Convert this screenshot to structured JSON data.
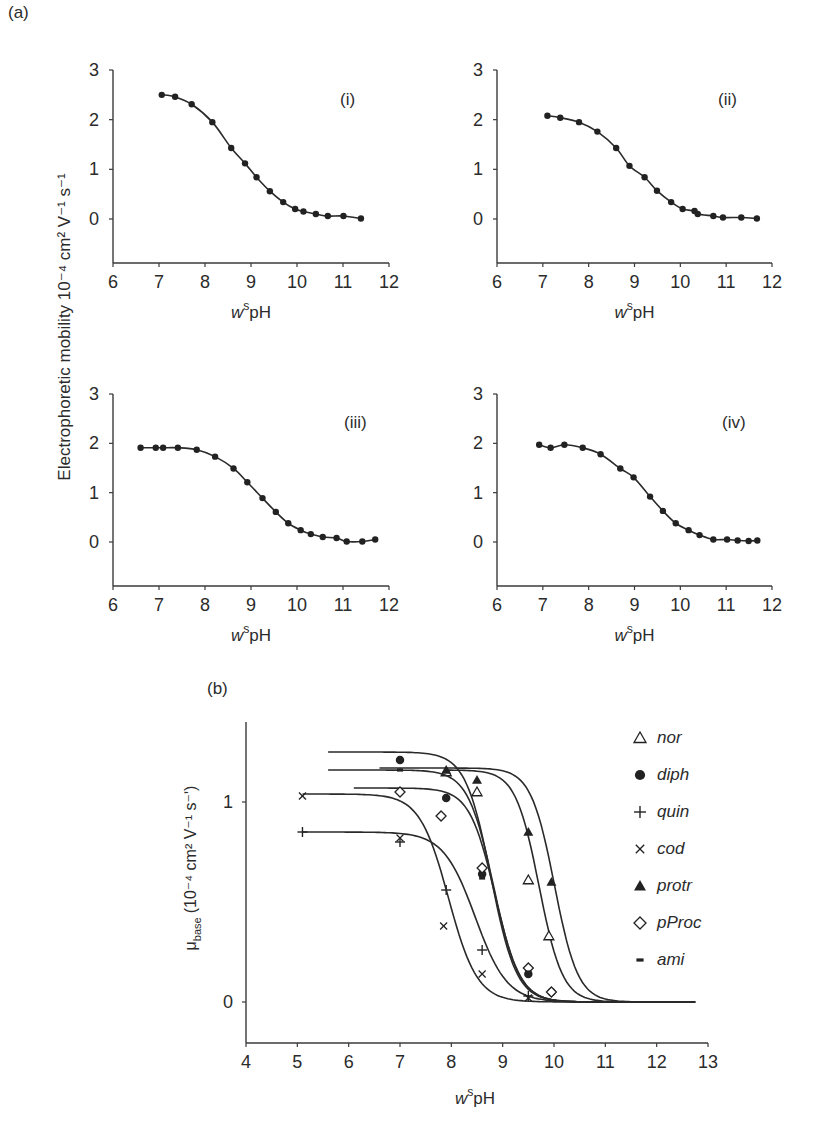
{
  "figure": {
    "label_a": "(a)",
    "label_b": "(b)",
    "ylabel_a": "Electrophoretic mobility 10⁻⁴ cm² V⁻¹ s⁻¹",
    "xlabel_prefix": "w",
    "xlabel_sup": "s",
    "xlabel_main": "pH",
    "ylabel_b_mu": "μ",
    "ylabel_b_sub": "base",
    "ylabel_b_units": "(10⁻⁴ cm² V⁻¹ s⁻ʹ)"
  },
  "chart_data": [
    {
      "type": "scatter",
      "panel": "(i)",
      "title": "(i)",
      "xlabel": "wspH",
      "ylabel": "Electrophoretic mobility 10^-4 cm^2 V^-1 s^-1",
      "xlim": [
        6,
        12
      ],
      "ylim": [
        -0.9,
        3
      ],
      "xticks": [
        6,
        7,
        8,
        9,
        10,
        11,
        12
      ],
      "yticks": [
        0,
        1,
        2,
        3
      ],
      "grid": false,
      "marker": "filled-circle",
      "fit_line": true,
      "x": [
        7.06,
        7.35,
        7.71,
        8.16,
        8.57,
        8.87,
        9.12,
        9.41,
        9.7,
        9.96,
        10.14,
        10.41,
        10.67,
        11.01,
        11.39
      ],
      "y": [
        2.5,
        2.46,
        2.31,
        1.95,
        1.43,
        1.12,
        0.84,
        0.56,
        0.34,
        0.2,
        0.15,
        0.1,
        0.06,
        0.06,
        0.01
      ]
    },
    {
      "type": "scatter",
      "panel": "(ii)",
      "title": "(ii)",
      "xlabel": "wspH",
      "xlim": [
        6,
        12
      ],
      "ylim": [
        -0.9,
        3
      ],
      "xticks": [
        6,
        7,
        8,
        9,
        10,
        11,
        12
      ],
      "yticks": [
        0,
        1,
        2,
        3
      ],
      "grid": false,
      "marker": "filled-circle",
      "fit_line": true,
      "x": [
        7.1,
        7.38,
        7.79,
        8.19,
        8.6,
        8.89,
        9.22,
        9.49,
        9.8,
        10.05,
        10.31,
        10.38,
        10.72,
        10.93,
        11.33,
        11.67
      ],
      "y": [
        2.08,
        2.04,
        1.95,
        1.76,
        1.43,
        1.07,
        0.84,
        0.57,
        0.34,
        0.2,
        0.16,
        0.1,
        0.06,
        0.03,
        0.03,
        0.01
      ]
    },
    {
      "type": "scatter",
      "panel": "(iii)",
      "title": "(iii)",
      "xlabel": "wspH",
      "xlim": [
        6,
        12
      ],
      "ylim": [
        -0.9,
        3
      ],
      "xticks": [
        6,
        7,
        8,
        9,
        10,
        11,
        12
      ],
      "yticks": [
        0,
        1,
        2,
        3
      ],
      "grid": false,
      "marker": "filled-circle",
      "fit_line": true,
      "x": [
        6.6,
        6.93,
        7.09,
        7.41,
        7.82,
        8.22,
        8.62,
        8.92,
        9.25,
        9.54,
        9.81,
        10.08,
        10.3,
        10.56,
        10.86,
        11.08,
        11.42,
        11.7
      ],
      "y": [
        1.91,
        1.91,
        1.91,
        1.91,
        1.87,
        1.73,
        1.49,
        1.21,
        0.89,
        0.61,
        0.38,
        0.24,
        0.16,
        0.1,
        0.08,
        0.01,
        0.01,
        0.05
      ]
    },
    {
      "type": "scatter",
      "panel": "(iv)",
      "title": "(iv)",
      "xlabel": "wspH",
      "xlim": [
        6,
        12
      ],
      "ylim": [
        -0.9,
        3
      ],
      "xticks": [
        6,
        7,
        8,
        9,
        10,
        11,
        12
      ],
      "yticks": [
        0,
        1,
        2,
        3
      ],
      "grid": false,
      "marker": "filled-circle",
      "fit_line": true,
      "x": [
        6.92,
        7.17,
        7.47,
        7.87,
        8.26,
        8.69,
        8.98,
        9.34,
        9.62,
        9.9,
        10.18,
        10.42,
        10.72,
        11.02,
        11.25,
        11.49,
        11.68
      ],
      "y": [
        1.97,
        1.91,
        1.97,
        1.91,
        1.78,
        1.49,
        1.31,
        0.92,
        0.63,
        0.38,
        0.24,
        0.14,
        0.05,
        0.05,
        0.03,
        0.02,
        0.03
      ]
    },
    {
      "type": "line",
      "panel": "(b)",
      "title": "(b)",
      "xlabel": "wspH",
      "ylabel": "μ_base (10^-4 cm^2 V^-1 s^-1)",
      "xlim": [
        4,
        13
      ],
      "ylim": [
        -0.2,
        1.4
      ],
      "xticks": [
        4,
        5,
        6,
        7,
        8,
        9,
        10,
        11,
        12,
        13
      ],
      "yticks": [
        0,
        1
      ],
      "grid": false,
      "legend_position": "upper right",
      "series": [
        {
          "name": "nor",
          "marker": "open-triangle",
          "start": 7.9,
          "mu": 1.16,
          "pKa": 9.55,
          "slope": 1.9,
          "points": [
            [
              7.9,
              1.15
            ],
            [
              8.5,
              1.05
            ],
            [
              9.5,
              0.61
            ],
            [
              9.9,
              0.33
            ]
          ]
        },
        {
          "name": "diph",
          "marker": "filled-circle",
          "start": 5.6,
          "mu": 1.25,
          "pKa": 8.6,
          "slope": 1.75,
          "points": [
            [
              7.0,
              1.21
            ],
            [
              7.9,
              1.02
            ],
            [
              8.6,
              0.64
            ],
            [
              9.5,
              0.14
            ],
            [
              9.95,
              0.05
            ]
          ]
        },
        {
          "name": "quin",
          "marker": "plus",
          "start": 5.1,
          "mu": 0.85,
          "pKa": 8.25,
          "slope": 1.4,
          "points": [
            [
              5.1,
              0.85
            ],
            [
              7.0,
              0.8
            ],
            [
              7.9,
              0.56
            ],
            [
              8.6,
              0.26
            ],
            [
              9.5,
              0.03
            ]
          ]
        },
        {
          "name": "cod",
          "marker": "x",
          "start": 5.1,
          "mu": 1.04,
          "pKa": 7.75,
          "slope": 1.55,
          "points": [
            [
              5.1,
              1.03
            ],
            [
              7.0,
              0.82
            ],
            [
              7.85,
              0.38
            ],
            [
              8.6,
              0.14
            ],
            [
              9.5,
              0.02
            ]
          ]
        },
        {
          "name": "protr",
          "marker": "filled-triangle",
          "start": 6.6,
          "mu": 1.17,
          "pKa": 9.85,
          "slope": 1.9,
          "points": [
            [
              7.9,
              1.16
            ],
            [
              8.5,
              1.11
            ],
            [
              9.5,
              0.85
            ],
            [
              9.95,
              0.6
            ]
          ]
        },
        {
          "name": "pProc",
          "marker": "open-diamond",
          "start": 6.1,
          "mu": 1.07,
          "pKa": 8.68,
          "slope": 1.75,
          "points": [
            [
              7.0,
              1.05
            ],
            [
              7.8,
              0.93
            ],
            [
              8.6,
              0.67
            ],
            [
              9.5,
              0.17
            ],
            [
              9.95,
              0.05
            ]
          ]
        },
        {
          "name": "ami",
          "marker": "dash",
          "start": 5.6,
          "mu": 1.16,
          "pKa": 8.65,
          "slope": 1.75,
          "points": [
            [
              7.0,
              1.16
            ],
            [
              8.6,
              0.62
            ],
            [
              9.5,
              0.15
            ]
          ]
        }
      ]
    }
  ],
  "panels_a_layout": [
    {
      "x0": 113,
      "x1": 389,
      "ytop": 70,
      "ybot": 263,
      "y3": 70,
      "y0": 219,
      "label_x": 340,
      "label_y": 105
    },
    {
      "x0": 497,
      "x1": 772,
      "ytop": 70,
      "ybot": 263,
      "y3": 70,
      "y0": 219,
      "label_x": 718,
      "label_y": 105
    },
    {
      "x0": 113,
      "x1": 389,
      "ytop": 394,
      "ybot": 586,
      "y3": 394,
      "y0": 542,
      "label_x": 344,
      "label_y": 428
    },
    {
      "x0": 497,
      "x1": 772,
      "ytop": 394,
      "ybot": 586,
      "y3": 394,
      "y0": 542,
      "label_x": 722,
      "label_y": 428
    }
  ]
}
